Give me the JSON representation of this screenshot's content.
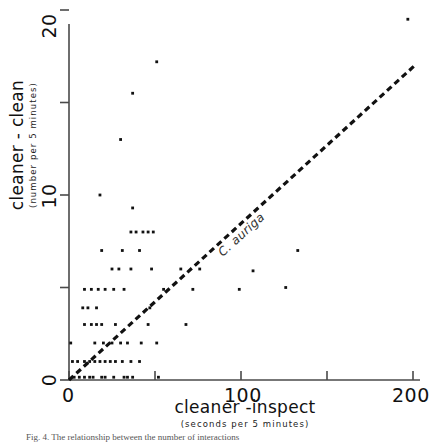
{
  "figure": {
    "caption": "Fig. 4. The relationship between the number of interactions"
  },
  "axes": {
    "x": {
      "title": "cleaner -inspect",
      "subtitle": "(seconds per 5 minutes)",
      "ticks": [
        0,
        50,
        100,
        150,
        200
      ],
      "tick_labels": [
        "0",
        "",
        "100",
        "",
        "200"
      ],
      "min": 0,
      "max": 210
    },
    "y": {
      "title": "cleaner - clean",
      "subtitle": "(number per 5 minutes)",
      "ticks": [
        0,
        5,
        10,
        15,
        20
      ],
      "tick_labels": [
        "0",
        "",
        "10",
        "",
        "20"
      ],
      "min": 0,
      "max": 21.5
    }
  },
  "annotations": [
    {
      "name": "species-label",
      "text": "C. auriga",
      "x": 88,
      "y": 7.2
    }
  ],
  "chart_data": {
    "type": "scatter",
    "title": "",
    "xlabel": "cleaner -inspect (seconds per 5 minutes)",
    "ylabel": "cleaner - clean (number per 5 minutes)",
    "xlim": [
      0,
      210
    ],
    "ylim": [
      0,
      21.5
    ],
    "grid": false,
    "legend": null,
    "series": [
      {
        "name": "C. auriga",
        "marker": "dot",
        "color": "#111111",
        "points": [
          [
            3,
            0.15
          ],
          [
            6,
            0.15
          ],
          [
            9,
            0.15
          ],
          [
            12,
            0.15
          ],
          [
            14,
            0.15
          ],
          [
            19,
            0.15
          ],
          [
            21,
            0.15
          ],
          [
            26,
            0.15
          ],
          [
            32,
            0.15
          ],
          [
            34,
            0.15
          ],
          [
            37,
            0.15
          ],
          [
            52,
            0.15
          ],
          [
            2,
            1.0
          ],
          [
            5,
            1.0
          ],
          [
            9,
            1.0
          ],
          [
            12,
            1.0
          ],
          [
            15,
            1.0
          ],
          [
            18,
            1.0
          ],
          [
            21,
            1.0
          ],
          [
            24,
            1.0
          ],
          [
            27,
            1.0
          ],
          [
            31,
            1.0
          ],
          [
            36,
            1.0
          ],
          [
            41,
            1.0
          ],
          [
            1,
            2.0
          ],
          [
            15,
            2.0
          ],
          [
            20,
            2.0
          ],
          [
            25,
            2.0
          ],
          [
            30,
            2.0
          ],
          [
            34,
            2.0
          ],
          [
            42,
            2.0
          ],
          [
            51,
            2.0
          ],
          [
            9,
            3.0
          ],
          [
            13,
            3.0
          ],
          [
            16,
            3.0
          ],
          [
            19,
            3.0
          ],
          [
            27,
            3.0
          ],
          [
            46,
            3.0
          ],
          [
            68,
            3.0
          ],
          [
            8,
            3.9
          ],
          [
            11,
            3.9
          ],
          [
            16,
            3.9
          ],
          [
            47,
            3.9
          ],
          [
            9,
            4.9
          ],
          [
            13,
            4.9
          ],
          [
            17,
            4.9
          ],
          [
            21,
            4.9
          ],
          [
            26,
            4.9
          ],
          [
            32,
            4.9
          ],
          [
            55,
            4.9
          ],
          [
            72,
            4.9
          ],
          [
            99,
            4.9
          ],
          [
            25,
            6.0
          ],
          [
            29,
            6.0
          ],
          [
            36,
            6.0
          ],
          [
            48,
            6.0
          ],
          [
            65,
            6.0
          ],
          [
            76,
            6.0
          ],
          [
            19,
            7.0
          ],
          [
            31,
            7.0
          ],
          [
            41,
            7.0
          ],
          [
            36,
            8.0
          ],
          [
            39,
            8.0
          ],
          [
            43,
            8.0
          ],
          [
            46,
            8.0
          ],
          [
            49,
            8.0
          ],
          [
            37,
            9.3
          ],
          [
            107,
            5.9
          ],
          [
            133,
            7.0
          ],
          [
            126,
            5.0
          ],
          [
            18,
            10.0
          ],
          [
            30,
            13.0
          ],
          [
            37,
            15.5
          ],
          [
            51,
            17.2
          ],
          [
            197,
            19.5
          ]
        ]
      }
    ],
    "fit_line": {
      "name": "regression-line",
      "style": "dashed",
      "color": "#111111",
      "x_start": 0,
      "y_start": 0,
      "x_end": 201,
      "y_end": 17.0
    }
  }
}
